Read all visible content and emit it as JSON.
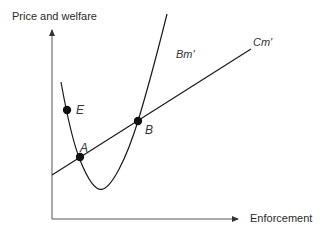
{
  "diagram": {
    "y_axis_label": "Price and welfare",
    "x_axis_label": "Enforcement",
    "curves": [
      {
        "name": "Bm'",
        "label": "Bm'",
        "shape": "U-shaped parabola"
      },
      {
        "name": "Cm'",
        "label": "Cm'",
        "shape": "upward-sloping line"
      }
    ],
    "points": [
      {
        "label": "E",
        "description": "point on Bm' above Cm'"
      },
      {
        "label": "A",
        "description": "lower intersection of Bm' and Cm'"
      },
      {
        "label": "B",
        "description": "upper intersection of Bm' and Cm'"
      }
    ],
    "colors": {
      "line": "#1a1a1a",
      "axis": "#444444",
      "text": "#2a2a2a"
    }
  }
}
